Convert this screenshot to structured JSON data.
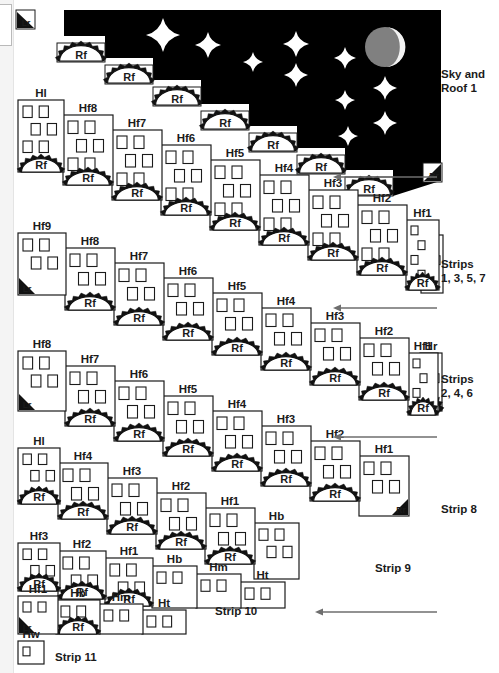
{
  "diagram": {
    "colors": {
      "sky": "#000000",
      "building_fill": "#ffffff",
      "outline": "#1b1b1b",
      "moon_body": "#808080",
      "moon_lit": "#f2f2f2",
      "star": "#ffffff",
      "arrow": "#6e6e6e",
      "text": "#1b1b1b"
    },
    "side_labels": [
      {
        "id": "sky-and-roof-1",
        "text": "Sky and\nRoof 1",
        "x": 441,
        "y": 68
      },
      {
        "id": "strips-1357",
        "text": "Strips\n1, 3, 5, 7",
        "x": 441,
        "y": 258
      },
      {
        "id": "strips-246",
        "text": "Strips\n2, 4, 6",
        "x": 441,
        "y": 373
      },
      {
        "id": "strip-8",
        "text": "Strip 8",
        "x": 441,
        "y": 503
      },
      {
        "id": "strip-9",
        "text": "Strip 9",
        "x": 375,
        "y": 562
      },
      {
        "id": "strip-10",
        "text": "Strip 10",
        "x": 215,
        "y": 605
      },
      {
        "id": "strip-11",
        "text": "Strip 11",
        "x": 55,
        "y": 651
      }
    ],
    "arrows": [
      {
        "id": "arrow-roof1",
        "x1": 437,
        "y1": 177,
        "x2": 333,
        "y2": 177
      },
      {
        "id": "arrow-strips1",
        "x1": 437,
        "y1": 308,
        "x2": 333,
        "y2": 308
      },
      {
        "id": "arrow-strips2",
        "x1": 437,
        "y1": 437,
        "x2": 333,
        "y2": 437
      },
      {
        "id": "arrow-strip10",
        "x1": 437,
        "y1": 612,
        "x2": 315,
        "y2": 612
      }
    ],
    "sky": {
      "label_left_roof": "Lr",
      "label_right_roof": "Rr",
      "roof_label": "Rf",
      "roof_labels": [
        "Rf",
        "Rf",
        "Rf",
        "Rf",
        "Rf",
        "Rf",
        "Rf",
        "Rf"
      ],
      "stars": [
        {
          "cx": 163,
          "cy": 35,
          "r": 17
        },
        {
          "cx": 208,
          "cy": 45,
          "r": 13
        },
        {
          "cx": 253,
          "cy": 62,
          "r": 10
        },
        {
          "cx": 296,
          "cy": 44,
          "r": 13
        },
        {
          "cx": 296,
          "cy": 75,
          "r": 12
        },
        {
          "cx": 345,
          "cy": 58,
          "r": 11
        },
        {
          "cx": 345,
          "cy": 100,
          "r": 10
        },
        {
          "cx": 385,
          "cy": 88,
          "r": 12
        },
        {
          "cx": 385,
          "cy": 123,
          "r": 12
        },
        {
          "cx": 348,
          "cy": 136,
          "r": 10
        }
      ],
      "moon": {
        "cx": 385,
        "cy": 47,
        "r": 20
      }
    },
    "rows": [
      {
        "id": "row-sky-roof-1",
        "note": "black sky silhouette with stepped roof skyline",
        "buildings": []
      },
      {
        "id": "row-front-a",
        "note": "front row of strip under sky",
        "buildings": [
          {
            "label": "Hl",
            "roof": "Rf"
          },
          {
            "label": "Hf8",
            "roof": "Rf"
          },
          {
            "label": "Hf7",
            "roof": "Rf"
          },
          {
            "label": "Hf6",
            "roof": "Rf"
          },
          {
            "label": "Hf5",
            "roof": "Rf"
          },
          {
            "label": "Hf4",
            "roof": "Rf"
          },
          {
            "label": "Hf3",
            "roof": "Rf"
          },
          {
            "label": "Hf2",
            "roof": "Rf"
          },
          {
            "label": "Hf1",
            "roof": "Rf"
          },
          {
            "label": "Hr",
            "roof": ""
          }
        ]
      },
      {
        "id": "row-strips-1357",
        "buildings": [
          {
            "label": "Hf9",
            "roof": "Lr"
          },
          {
            "label": "Hf8",
            "roof": "Rf"
          },
          {
            "label": "Hf7",
            "roof": "Rf"
          },
          {
            "label": "Hf6",
            "roof": "Rf"
          },
          {
            "label": "Hf5",
            "roof": "Rf"
          },
          {
            "label": "Hf4",
            "roof": "Rf"
          },
          {
            "label": "Hf3",
            "roof": "Rf"
          },
          {
            "label": "Hf2",
            "roof": "Rf"
          },
          {
            "label": "Hf1",
            "roof": "Rf"
          },
          {
            "label": "Hr",
            "roof": "Rf"
          }
        ]
      },
      {
        "id": "row-strips-246",
        "buildings": [
          {
            "label": "Hf8",
            "roof": "Lr"
          },
          {
            "label": "Hf7",
            "roof": "Rf"
          },
          {
            "label": "Hf6",
            "roof": "Rf"
          },
          {
            "label": "Hf5",
            "roof": "Rf"
          },
          {
            "label": "Hf4",
            "roof": "Rf"
          },
          {
            "label": "Hf3",
            "roof": "Rf"
          },
          {
            "label": "Hf2",
            "roof": "Rf"
          },
          {
            "label": "Hf1",
            "roof": "Rr"
          }
        ]
      },
      {
        "id": "row-strip-8",
        "buildings": [
          {
            "label": "Hl",
            "roof": "Rf"
          },
          {
            "label": "Hf4",
            "roof": "Rf"
          },
          {
            "label": "Hf3",
            "roof": "Rf"
          },
          {
            "label": "Hf2",
            "roof": "Rf"
          },
          {
            "label": "Hf1",
            "roof": "Rf"
          },
          {
            "label": "Hb",
            "roof": ""
          }
        ]
      },
      {
        "id": "row-strip-9",
        "buildings": [
          {
            "label": "Hf3",
            "roof": "Rf"
          },
          {
            "label": "Hf2",
            "roof": "Rf"
          },
          {
            "label": "Hf1",
            "roof": "Rf"
          },
          {
            "label": "Hb",
            "roof": ""
          },
          {
            "label": "Hm",
            "roof": ""
          },
          {
            "label": "Ht",
            "roof": ""
          }
        ]
      },
      {
        "id": "row-strip-10",
        "buildings": [
          {
            "label": "Hf1",
            "roof": "Lr"
          },
          {
            "label": "Hb",
            "roof": "Rf"
          },
          {
            "label": "Hm",
            "roof": ""
          },
          {
            "label": "Ht",
            "roof": ""
          }
        ]
      },
      {
        "id": "row-strip-11",
        "buildings": [
          {
            "label": "Hw",
            "roof": ""
          }
        ]
      }
    ],
    "building_labels_flat": [
      "Lr",
      "Rf",
      "Hl",
      "Hf9",
      "Hf8",
      "Hf7",
      "Hf6",
      "Hf5",
      "Hf4",
      "Hf3",
      "Hf2",
      "Hf1",
      "Hr",
      "Hb",
      "Hm",
      "Ht",
      "Hw",
      "Rr"
    ]
  }
}
